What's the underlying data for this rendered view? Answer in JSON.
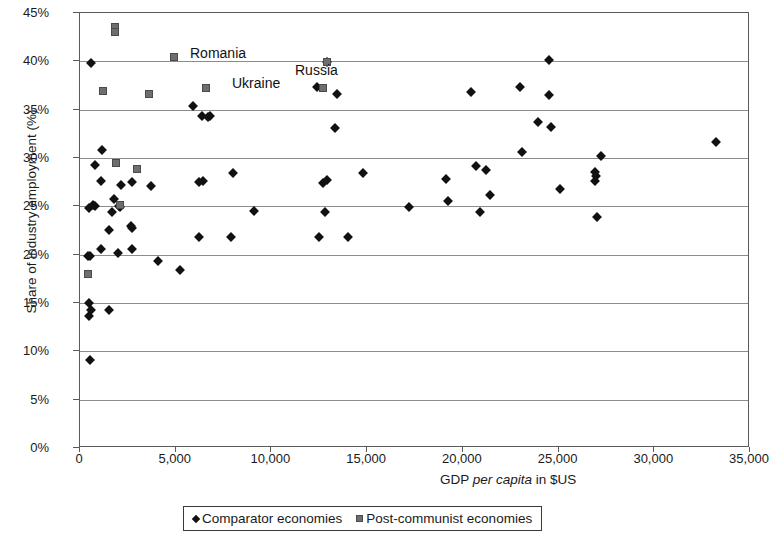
{
  "chart_data": {
    "type": "scatter",
    "title": "",
    "xlabel": "GDP per capita in $US",
    "ylabel": "Share of industry employment (%)",
    "xlim": [
      0,
      35000
    ],
    "ylim": [
      0,
      45
    ],
    "xticks": [
      "0",
      "5,000",
      "10,000",
      "15,000",
      "20,000",
      "25,000",
      "30,000",
      "35,000"
    ],
    "xtick_values": [
      0,
      5000,
      10000,
      15000,
      20000,
      25000,
      30000,
      35000
    ],
    "yticks": [
      "0%",
      "5%",
      "10%",
      "15%",
      "20%",
      "25%",
      "30%",
      "35%",
      "40%",
      "45%"
    ],
    "ytick_values": [
      0,
      5,
      10,
      15,
      20,
      25,
      30,
      35,
      40,
      45
    ],
    "grid": "horizontal",
    "legend_position": "bottom",
    "series": [
      {
        "name": "Comparator economies",
        "marker": "diamond",
        "color": "#111111",
        "points": [
          [
            520,
            9.1
          ],
          [
            470,
            13.7
          ],
          [
            600,
            14.3
          ],
          [
            1500,
            14.3
          ],
          [
            470,
            15.0
          ],
          [
            400,
            19.9
          ],
          [
            520,
            19.9
          ],
          [
            1100,
            20.6
          ],
          [
            2000,
            20.2
          ],
          [
            2700,
            20.6
          ],
          [
            4100,
            19.3
          ],
          [
            5200,
            18.4
          ],
          [
            1500,
            22.6
          ],
          [
            2650,
            23.0
          ],
          [
            2700,
            22.8
          ],
          [
            6200,
            21.8
          ],
          [
            7900,
            21.8
          ],
          [
            12500,
            21.8
          ],
          [
            14000,
            21.8
          ],
          [
            450,
            24.8
          ],
          [
            700,
            25.1
          ],
          [
            800,
            25.0
          ],
          [
            1650,
            24.4
          ],
          [
            2050,
            25.0
          ],
          [
            2100,
            24.9
          ],
          [
            9100,
            24.5
          ],
          [
            12800,
            24.4
          ],
          [
            17200,
            24.9
          ],
          [
            20900,
            24.4
          ],
          [
            27000,
            23.9
          ],
          [
            1800,
            25.8
          ],
          [
            19200,
            25.6
          ],
          [
            21400,
            26.2
          ],
          [
            25100,
            26.8
          ],
          [
            1100,
            27.6
          ],
          [
            2150,
            27.2
          ],
          [
            2700,
            27.5
          ],
          [
            3700,
            27.1
          ],
          [
            6200,
            27.5
          ],
          [
            6400,
            27.6
          ],
          [
            12700,
            27.4
          ],
          [
            12900,
            27.7
          ],
          [
            19100,
            27.8
          ],
          [
            26900,
            27.6
          ],
          [
            26950,
            28.1
          ],
          [
            8000,
            28.5
          ],
          [
            14800,
            28.5
          ],
          [
            20700,
            29.2
          ],
          [
            21200,
            28.8
          ],
          [
            26900,
            28.6
          ],
          [
            800,
            29.3
          ],
          [
            1150,
            30.8
          ],
          [
            23100,
            30.6
          ],
          [
            27200,
            30.2
          ],
          [
            13300,
            33.1
          ],
          [
            24600,
            33.2
          ],
          [
            23900,
            33.7
          ],
          [
            33200,
            31.7
          ],
          [
            6350,
            34.3
          ],
          [
            6700,
            34.2
          ],
          [
            6800,
            34.3
          ],
          [
            5900,
            35.4
          ],
          [
            12400,
            37.3
          ],
          [
            13400,
            36.6
          ],
          [
            20400,
            36.8
          ],
          [
            23000,
            37.3
          ],
          [
            24500,
            36.5
          ],
          [
            24500,
            40.1
          ],
          [
            600,
            39.8
          ],
          [
            12900,
            39.9
          ]
        ]
      },
      {
        "name": "Post-communist economies",
        "marker": "square",
        "color": "#6e6e6e",
        "points": [
          [
            400,
            18.0
          ],
          [
            1900,
            29.5
          ],
          [
            3000,
            28.9
          ],
          [
            2100,
            25.1
          ],
          [
            1200,
            36.9
          ],
          [
            3600,
            36.6
          ],
          [
            6600,
            37.2
          ],
          [
            12700,
            37.2
          ],
          [
            4900,
            40.5
          ],
          [
            12900,
            39.9
          ],
          [
            1850,
            43.6
          ],
          [
            1850,
            43.0
          ]
        ]
      }
    ],
    "annotations": [
      {
        "text": "Romania",
        "x": 1850,
        "y": 43.6,
        "label_x_px": 110,
        "label_y_px": 33
      },
      {
        "text": "Ukraine",
        "x": 4900,
        "y": 40.5,
        "label_x_px": 152,
        "label_y_px": 63
      },
      {
        "text": "Russia",
        "x": 12900,
        "y": 39.9,
        "label_x_px": 215,
        "label_y_px": 50
      }
    ]
  },
  "legend": {
    "entries": [
      {
        "label": "Comparator economies",
        "marker": "diamond"
      },
      {
        "label": "Post-communist economies",
        "marker": "square"
      }
    ]
  }
}
